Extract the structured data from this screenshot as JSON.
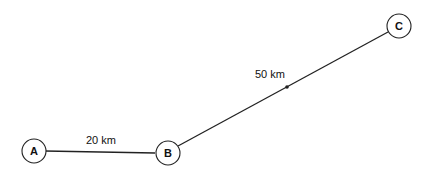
{
  "diagram": {
    "nodes": [
      {
        "id": "A",
        "label": "A",
        "x": 34,
        "y": 176
      },
      {
        "id": "B",
        "label": "B",
        "x": 168,
        "y": 180
      },
      {
        "id": "C",
        "label": "C",
        "x": 401,
        "y": 54
      }
    ],
    "edges": [
      {
        "from": "A",
        "to": "B",
        "label": "20 km"
      },
      {
        "from": "B",
        "to": "C",
        "label": "50 km"
      }
    ]
  }
}
